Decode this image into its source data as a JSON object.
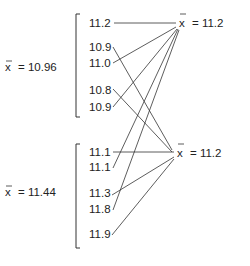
{
  "groups": [
    {
      "mean_label": "x̄ = 10.96",
      "mean_symbol": "x",
      "mean_value_text": "= 10.96",
      "values": [
        "11.2",
        "10.9",
        "11.0",
        "10.8",
        "10.9"
      ]
    },
    {
      "mean_label": "x̄ = 11.44",
      "mean_symbol": "x",
      "mean_value_text": "= 11.44",
      "values": [
        "11.1",
        "11.1",
        "11.3",
        "11.8",
        "11.9"
      ]
    }
  ],
  "targets": [
    {
      "mean_label": "x̄ = 11.2",
      "mean_symbol": "x",
      "mean_value_text": "= 11.2"
    },
    {
      "mean_label": "x̄ = 11.2",
      "mean_symbol": "x",
      "mean_value_text": "= 11.2"
    }
  ],
  "connections": [
    {
      "from": "group0.item0",
      "value": "11.2",
      "to": "target0"
    },
    {
      "from": "group0.item1",
      "value": "10.9",
      "to": "target1"
    },
    {
      "from": "group0.item2",
      "value": "11.0",
      "to": "target0"
    },
    {
      "from": "group0.item3",
      "value": "10.8",
      "to": "target1"
    },
    {
      "from": "group0.item4",
      "value": "10.9",
      "to": "target0"
    },
    {
      "from": "group1.item0",
      "value": "11.1",
      "to": "target1"
    },
    {
      "from": "group1.item1",
      "value": "11.1",
      "to": "target0"
    },
    {
      "from": "group1.item2",
      "value": "11.3",
      "to": "target1"
    },
    {
      "from": "group1.item3",
      "value": "11.8",
      "to": "target0"
    },
    {
      "from": "group1.item4",
      "value": "11.9",
      "to": "target1"
    }
  ]
}
